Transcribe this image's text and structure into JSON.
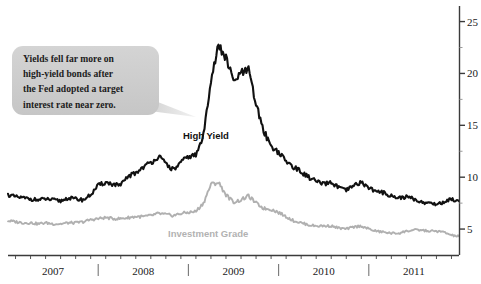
{
  "chart_data": {
    "type": "line",
    "title": "",
    "xlabel": "",
    "ylabel": "",
    "ylim": [
      2.5,
      26.5
    ],
    "ytick_values": [
      5,
      10,
      15,
      20,
      25
    ],
    "ytick_labels": [
      "5",
      "10",
      "15",
      "20",
      "25"
    ],
    "yminor_values": [
      7.5,
      12.5,
      17.5,
      22.5
    ],
    "y_axis_position": "right",
    "grid": false,
    "legend": "inline-labels",
    "xlim": [
      "2006-07",
      "2011-07"
    ],
    "xtick_labels": [
      "2007",
      "2008",
      "2009",
      "2010",
      "2011"
    ],
    "x_divider_labels": [
      "2007|2008",
      "2008|2009",
      "2009|2010",
      "2010|2011"
    ],
    "series": [
      {
        "name": "High Yield",
        "color": "#111111",
        "x": [
          "2006-07",
          "2006-08",
          "2006-09",
          "2006-10",
          "2006-11",
          "2006-12",
          "2007-01",
          "2007-02",
          "2007-03",
          "2007-04",
          "2007-05",
          "2007-06",
          "2007-07",
          "2007-08",
          "2007-09",
          "2007-10",
          "2007-11",
          "2007-12",
          "2008-01",
          "2008-02",
          "2008-03",
          "2008-04",
          "2008-05",
          "2008-06",
          "2008-07",
          "2008-08",
          "2008-09",
          "2008-10",
          "2008-11",
          "2008-12",
          "2009-01",
          "2009-02",
          "2009-03",
          "2009-04",
          "2009-05",
          "2009-06",
          "2009-07",
          "2009-08",
          "2009-09",
          "2009-10",
          "2009-11",
          "2009-12",
          "2010-01",
          "2010-02",
          "2010-03",
          "2010-04",
          "2010-05",
          "2010-06",
          "2010-07",
          "2010-08",
          "2010-09",
          "2010-10",
          "2010-11",
          "2010-12",
          "2011-01",
          "2011-02",
          "2011-03",
          "2011-04",
          "2011-05",
          "2011-06",
          "2011-07"
        ],
        "values": [
          8.3,
          8.1,
          8.0,
          7.9,
          7.8,
          7.9,
          7.8,
          7.7,
          8.0,
          7.9,
          7.8,
          8.3,
          9.2,
          9.5,
          9.3,
          9.2,
          10.1,
          10.4,
          11.0,
          11.4,
          12.0,
          11.3,
          10.7,
          11.4,
          12.0,
          12.1,
          14.0,
          19.5,
          22.6,
          21.5,
          19.2,
          20.0,
          20.3,
          17.0,
          14.5,
          13.0,
          12.4,
          11.5,
          11.0,
          10.5,
          10.0,
          9.6,
          9.3,
          9.5,
          9.0,
          8.7,
          9.2,
          9.5,
          9.0,
          8.6,
          8.5,
          8.2,
          8.0,
          8.1,
          7.9,
          7.6,
          7.5,
          7.4,
          7.6,
          7.9,
          7.7
        ]
      },
      {
        "name": "Investment Grade",
        "color": "#b0b0b0",
        "x": [
          "2006-07",
          "2006-08",
          "2006-09",
          "2006-10",
          "2006-11",
          "2006-12",
          "2007-01",
          "2007-02",
          "2007-03",
          "2007-04",
          "2007-05",
          "2007-06",
          "2007-07",
          "2007-08",
          "2007-09",
          "2007-10",
          "2007-11",
          "2007-12",
          "2008-01",
          "2008-02",
          "2008-03",
          "2008-04",
          "2008-05",
          "2008-06",
          "2008-07",
          "2008-08",
          "2008-09",
          "2008-10",
          "2008-11",
          "2008-12",
          "2009-01",
          "2009-02",
          "2009-03",
          "2009-04",
          "2009-05",
          "2009-06",
          "2009-07",
          "2009-08",
          "2009-09",
          "2009-10",
          "2009-11",
          "2009-12",
          "2010-01",
          "2010-02",
          "2010-03",
          "2010-04",
          "2010-05",
          "2010-06",
          "2010-07",
          "2010-08",
          "2010-09",
          "2010-10",
          "2010-11",
          "2010-12",
          "2011-01",
          "2011-02",
          "2011-03",
          "2011-04",
          "2011-05",
          "2011-06",
          "2011-07"
        ],
        "values": [
          5.8,
          5.7,
          5.6,
          5.6,
          5.5,
          5.6,
          5.5,
          5.5,
          5.6,
          5.6,
          5.7,
          5.9,
          6.0,
          6.1,
          6.0,
          6.0,
          6.1,
          6.2,
          6.2,
          6.3,
          6.5,
          6.4,
          6.3,
          6.5,
          6.6,
          6.7,
          7.5,
          9.3,
          9.5,
          8.3,
          7.6,
          7.8,
          8.2,
          7.5,
          7.0,
          6.9,
          6.6,
          6.2,
          5.8,
          5.6,
          5.4,
          5.3,
          5.3,
          5.3,
          5.1,
          5.0,
          5.2,
          5.3,
          5.0,
          4.8,
          4.7,
          4.6,
          4.6,
          4.8,
          4.9,
          4.9,
          4.8,
          4.8,
          4.7,
          4.4,
          4.3
        ]
      }
    ],
    "annotations": [
      {
        "type": "callout",
        "lines": [
          "Yields fell far more on",
          "high-yield bonds after",
          "the Fed adopted a target",
          "interest rate near zero."
        ],
        "fill": "#cdcdcd",
        "points_to": "High Yield series, late 2008"
      }
    ]
  }
}
